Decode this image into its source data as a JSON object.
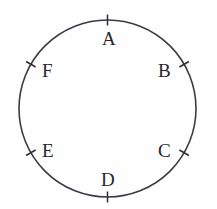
{
  "figure": {
    "type": "geometry-diagram",
    "background_color": "#fefefe",
    "stroke_color": "#3b3b45",
    "label_color": "#27272e",
    "circle": {
      "center_x": 107.5,
      "center_y": 108.5,
      "radius": 88.5
    },
    "points": [
      {
        "id": "A",
        "label": "A",
        "angle_deg": 90,
        "tick_angle_deg": 90,
        "label_x": 102,
        "label_y": 29
      },
      {
        "id": "B",
        "label": "B",
        "angle_deg": 30,
        "tick_angle_deg": 30,
        "label_x": 158,
        "label_y": 61
      },
      {
        "id": "C",
        "label": "C",
        "angle_deg": -30,
        "tick_angle_deg": -30,
        "label_x": 158,
        "label_y": 141
      },
      {
        "id": "D",
        "label": "D",
        "angle_deg": -90,
        "tick_angle_deg": -90,
        "label_x": 101,
        "label_y": 170
      },
      {
        "id": "E",
        "label": "E",
        "angle_deg": -150,
        "tick_angle_deg": -150,
        "label_x": 42,
        "label_y": 141
      },
      {
        "id": "F",
        "label": "F",
        "angle_deg": 150,
        "tick_angle_deg": 150,
        "label_x": 42,
        "label_y": 61
      }
    ]
  }
}
